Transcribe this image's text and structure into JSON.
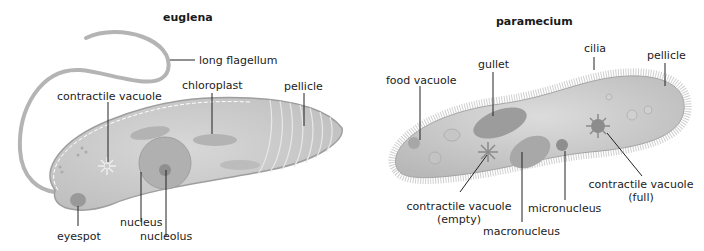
{
  "euglena": {
    "title": "euglena",
    "labels": {
      "long_flagellum": "long flagellum",
      "contractile_vacuole": "contractile vacuole",
      "chloroplast": "chloroplast",
      "pellicle": "pellicle",
      "nucleus": "nucleus",
      "nucleolus": "nucleolus",
      "eyespot": "eyespot"
    }
  },
  "paramecium": {
    "title": "paramecium",
    "labels": {
      "food_vacuole": "food vacuole",
      "gullet": "gullet",
      "cilia": "cilia",
      "pellicle": "pellicle",
      "contractile_vacuole_empty_1": "contractile vacuole",
      "contractile_vacuole_empty_2": "(empty)",
      "micronucleus": "micronucleus",
      "macronucleus": "macronucleus",
      "contractile_vacuole_full_1": "contractile vacuole",
      "contractile_vacuole_full_2": "(full)"
    }
  },
  "colors": {
    "background": "#ffffff",
    "body_fill": "#cfcfcf",
    "body_stroke": "#a8a8a8",
    "organelle": "#b0b0b0",
    "leader_line": "#222222"
  }
}
